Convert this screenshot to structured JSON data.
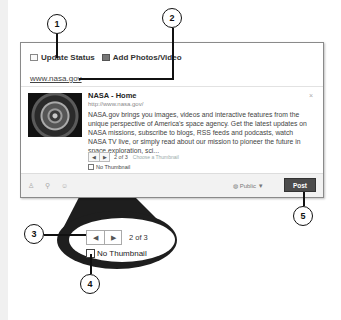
{
  "composer": {
    "tabs": [
      {
        "label": "Update Status",
        "icon": "status-icon"
      },
      {
        "label": "Add Photos/Video",
        "icon": "photo-icon"
      }
    ],
    "url_input": "www.nasa.gov"
  },
  "link_preview": {
    "title": "NASA - Home",
    "url": "http://www.nasa.gov/",
    "description": "NASA.gov brings you images, videos and interactive features from the unique perspective of America's space agency. Get the latest updates on NASA missions, subscribe to blogs, RSS feeds and podcasts, watch NASA TV live, or simply read about our mission to pioneer the future in space exploration, sci...",
    "close_glyph": "×",
    "pager": {
      "prev": "◀",
      "next": "▶",
      "count": "2 of 3",
      "choose_label": "Choose a Thumbnail"
    },
    "no_thumbnail_label": "No Thumbnail"
  },
  "bottom_bar": {
    "icons": [
      "tag-people-icon",
      "location-icon",
      "emoji-icon"
    ],
    "icon_glyphs": [
      "♙",
      "⚲",
      "☺"
    ],
    "privacy_label": "Public ▼",
    "privacy_glyph": "◍",
    "post_label": "Post"
  },
  "magnified": {
    "prev": "◀",
    "next": "▶",
    "count": "2 of 3",
    "no_thumbnail_label": "No Thumbnail"
  },
  "callouts": [
    "1",
    "2",
    "3",
    "4",
    "5"
  ],
  "colors": {
    "post_button": "#4c4c4c",
    "callout_stroke": "#111111",
    "magnifier_fill": "#222222"
  }
}
